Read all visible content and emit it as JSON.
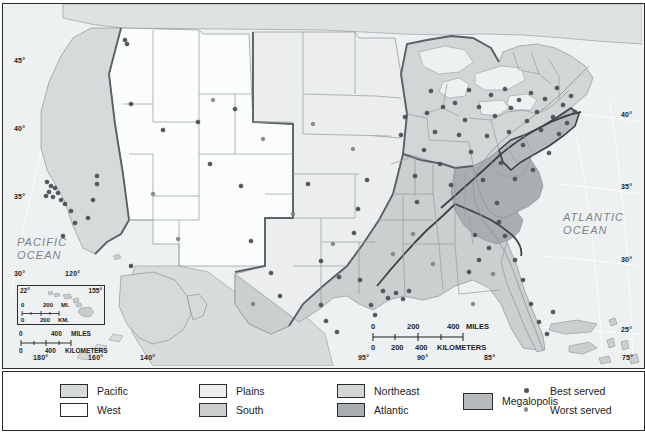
{
  "map": {
    "title": "United States regional service map",
    "ocean_labels": [
      {
        "name": "pacific-ocean-label",
        "line1": "PACIFIC",
        "line2": "OCEAN",
        "x": 14,
        "y": 238
      },
      {
        "name": "atlantic-ocean-label",
        "line1": "ATLANTIC",
        "line2": "OCEAN",
        "x": 562,
        "y": 213
      }
    ],
    "graticule": {
      "latitude_labels": [
        {
          "text": "45°",
          "x": 12,
          "y": 56
        },
        {
          "text": "40°",
          "x": 12,
          "y": 124
        },
        {
          "text": "35°",
          "x": 12,
          "y": 192
        },
        {
          "text": "30°",
          "x": 12,
          "y": 270
        },
        {
          "text": "40°",
          "x": 622,
          "y": 110
        },
        {
          "text": "35°",
          "x": 622,
          "y": 182
        },
        {
          "text": "30°",
          "x": 622,
          "y": 255
        },
        {
          "text": "25°",
          "x": 622,
          "y": 325
        }
      ],
      "longitude_labels": [
        {
          "text": "120°",
          "x": 66,
          "y": 270
        },
        {
          "text": "180°",
          "x": 33,
          "y": 357
        },
        {
          "text": "160°",
          "x": 88,
          "y": 357
        },
        {
          "text": "140°",
          "x": 140,
          "y": 357
        },
        {
          "text": "95°",
          "x": 358,
          "y": 357
        },
        {
          "text": "90°",
          "x": 417,
          "y": 357
        },
        {
          "text": "85°",
          "x": 484,
          "y": 357
        },
        {
          "text": "75°",
          "x": 622,
          "y": 357
        }
      ]
    },
    "main_scale": {
      "miles": {
        "start": "0",
        "mid": "200",
        "end": "400",
        "unit": "MILES"
      },
      "kilometers": {
        "start": "0",
        "mid": "200",
        "mid2": "400",
        "unit": "KILOMETERS"
      }
    },
    "alaska_scale": {
      "miles": {
        "start": "0",
        "end": "400",
        "unit": "MILES"
      },
      "kilometers": {
        "start": "0",
        "end": "400",
        "unit": "KILOMETERS"
      }
    },
    "hawaii_inset": {
      "name": "hawaii-inset",
      "lat_label": "22°",
      "lon_label": "155°",
      "scale": {
        "miles": {
          "start": "0",
          "end": "200",
          "unit": "MI."
        },
        "kilometers": {
          "start": "0",
          "end": "200",
          "unit": "KM."
        }
      }
    }
  },
  "legend": {
    "columns": [
      {
        "name": "legend-column-1",
        "x": 57,
        "entries": [
          {
            "label": "Pacific",
            "color": "#d7dadb",
            "name": "legend-swatch-pacific"
          },
          {
            "label": "West",
            "color": "#ffffff",
            "name": "legend-swatch-west"
          }
        ]
      },
      {
        "name": "legend-column-2",
        "x": 196,
        "entries": [
          {
            "label": "Plains",
            "color": "#ebedee",
            "name": "legend-swatch-plains"
          },
          {
            "label": "South",
            "color": "#cbcfd0",
            "name": "legend-swatch-south"
          }
        ]
      },
      {
        "name": "legend-column-3",
        "x": 334,
        "entries": [
          {
            "label": "Northeast",
            "color": "#d2d6d7",
            "name": "legend-swatch-northeast"
          },
          {
            "label": "Atlantic",
            "color": "#a9aeb0",
            "name": "legend-swatch-atlantic"
          }
        ]
      }
    ],
    "megalopolis": {
      "label": "Megalopolis",
      "color": "#b6babc",
      "x": 460,
      "name": "legend-swatch-megalopolis"
    },
    "dots": {
      "x": 513,
      "entries": [
        {
          "label": "Best served",
          "color": "#4f5557",
          "size": 4,
          "name": "legend-dot-best-served"
        },
        {
          "label": "Worst served",
          "color": "#8a9092",
          "size": 3.4,
          "name": "legend-dot-worst-served"
        }
      ]
    }
  },
  "colors": {
    "ocean": "#eef1f2",
    "land_west": "#fbfcfc",
    "land_pacific": "#d7dadb",
    "land_plains": "#ebedee",
    "land_south": "#cbcfd0",
    "land_northeast": "#d2d6d7",
    "land_atlantic": "#a9aeb0",
    "megalopolis": "#b6babc",
    "state_border": "#8e9497",
    "region_border": "#5b6164",
    "frame": "#2b2b2b",
    "dot_best": "#4f5557",
    "dot_worst": "#8a9092"
  },
  "cities": {
    "best_served": [
      [
        44,
        178
      ],
      [
        48,
        182
      ],
      [
        52,
        184
      ],
      [
        46,
        188
      ],
      [
        55,
        189
      ],
      [
        43,
        192
      ],
      [
        50,
        193
      ],
      [
        58,
        196
      ],
      [
        62,
        200
      ],
      [
        68,
        207
      ],
      [
        72,
        219
      ],
      [
        60,
        232
      ],
      [
        94,
        172
      ],
      [
        94,
        180
      ],
      [
        90,
        196
      ],
      [
        85,
        214
      ],
      [
        122,
        36
      ],
      [
        124,
        40
      ],
      [
        128,
        100
      ],
      [
        160,
        126
      ],
      [
        128,
        262
      ],
      [
        195,
        118
      ],
      [
        207,
        160
      ],
      [
        232,
        105
      ],
      [
        238,
        182
      ],
      [
        248,
        237
      ],
      [
        268,
        269
      ],
      [
        277,
        292
      ],
      [
        305,
        180
      ],
      [
        318,
        257
      ],
      [
        318,
        301
      ],
      [
        323,
        317
      ],
      [
        334,
        328
      ],
      [
        336,
        273
      ],
      [
        351,
        229
      ],
      [
        355,
        205
      ],
      [
        357,
        276
      ],
      [
        364,
        176
      ],
      [
        368,
        301
      ],
      [
        372,
        311
      ],
      [
        380,
        287
      ],
      [
        385,
        294
      ],
      [
        393,
        289
      ],
      [
        400,
        295
      ],
      [
        406,
        287
      ],
      [
        398,
        131
      ],
      [
        402,
        113
      ],
      [
        412,
        172
      ],
      [
        414,
        198
      ],
      [
        421,
        146
      ],
      [
        424,
        109
      ],
      [
        428,
        87
      ],
      [
        432,
        128
      ],
      [
        437,
        160
      ],
      [
        440,
        103
      ],
      [
        448,
        181
      ],
      [
        452,
        99
      ],
      [
        456,
        131
      ],
      [
        462,
        116
      ],
      [
        466,
        86
      ],
      [
        468,
        148
      ],
      [
        472,
        231
      ],
      [
        476,
        103
      ],
      [
        480,
        176
      ],
      [
        484,
        132
      ],
      [
        488,
        91
      ],
      [
        492,
        112
      ],
      [
        494,
        199
      ],
      [
        498,
        159
      ],
      [
        502,
        85
      ],
      [
        506,
        128
      ],
      [
        508,
        104
      ],
      [
        512,
        175
      ],
      [
        516,
        96
      ],
      [
        520,
        141
      ],
      [
        524,
        117
      ],
      [
        528,
        89
      ],
      [
        530,
        166
      ],
      [
        534,
        108
      ],
      [
        538,
        126
      ],
      [
        542,
        95
      ],
      [
        546,
        149
      ],
      [
        550,
        113
      ],
      [
        554,
        84
      ],
      [
        556,
        130
      ],
      [
        560,
        101
      ],
      [
        564,
        119
      ],
      [
        568,
        92
      ],
      [
        572,
        108
      ],
      [
        502,
        232
      ],
      [
        512,
        256
      ],
      [
        520,
        276
      ],
      [
        528,
        300
      ],
      [
        536,
        318
      ],
      [
        544,
        330
      ],
      [
        550,
        308
      ],
      [
        466,
        268
      ],
      [
        476,
        256
      ],
      [
        486,
        244
      ],
      [
        496,
        218
      ]
    ],
    "worst_served": [
      [
        150,
        190
      ],
      [
        175,
        235
      ],
      [
        210,
        96
      ],
      [
        260,
        135
      ],
      [
        290,
        210
      ],
      [
        330,
        240
      ],
      [
        390,
        250
      ],
      [
        430,
        260
      ],
      [
        470,
        300
      ],
      [
        250,
        300
      ],
      [
        310,
        120
      ],
      [
        350,
        145
      ],
      [
        410,
        230
      ],
      [
        490,
        270
      ]
    ]
  }
}
